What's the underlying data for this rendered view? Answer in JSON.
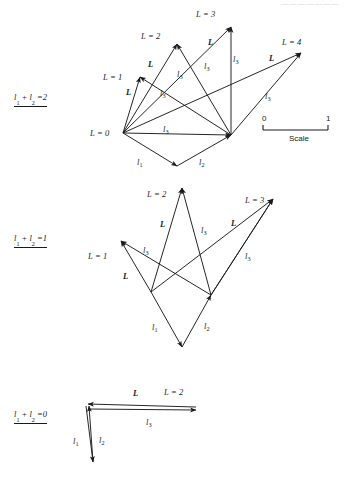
{
  "figure": {
    "header_ghost": "———————",
    "stroke_color": "#1a1a1a",
    "background_color": "#ffffff"
  },
  "panels": [
    {
      "id": "panel-top",
      "tag": "l₁ + l₂ = 2",
      "tag_parts": {
        "l1": "l",
        "sub1": "1",
        "plus": "+",
        "l2": "l",
        "sub2": "2",
        "eq": "=2"
      },
      "tag_pos": {
        "x": 14,
        "y": 92
      },
      "vertices": {
        "origin": {
          "label": "L = 0",
          "x": 123,
          "y": 133
        },
        "L1": {
          "label": "L = 1",
          "x": 140,
          "y": 77
        },
        "L2": {
          "label": "L = 2",
          "x": 177,
          "y": 44
        },
        "L3": {
          "label": "L = 3",
          "x": 231,
          "y": 27
        },
        "L4": {
          "label": "L = 4",
          "x": 301,
          "y": 53
        },
        "right": {
          "label": "",
          "x": 231,
          "y": 135
        },
        "bottom": {
          "label": "",
          "x": 177,
          "y": 166
        }
      },
      "arrows": [
        {
          "name": "L-to-L1",
          "x1": 123,
          "y1": 133,
          "x2": 140,
          "y2": 77,
          "label": "L"
        },
        {
          "name": "L-to-L2",
          "x1": 123,
          "y1": 133,
          "x2": 177,
          "y2": 44,
          "label": "L"
        },
        {
          "name": "L-to-L3",
          "x1": 123,
          "y1": 133,
          "x2": 231,
          "y2": 27,
          "label": "L"
        },
        {
          "name": "L-to-L4",
          "x1": 123,
          "y1": 133,
          "x2": 301,
          "y2": 53,
          "label": "L"
        },
        {
          "name": "l3-to-L1",
          "x1": 231,
          "y1": 135,
          "x2": 140,
          "y2": 77,
          "label": "l3"
        },
        {
          "name": "l3-to-L2",
          "x1": 231,
          "y1": 135,
          "x2": 177,
          "y2": 44,
          "label": "l3"
        },
        {
          "name": "l3-to-L3",
          "x1": 231,
          "y1": 135,
          "x2": 231,
          "y2": 27,
          "label": "l3"
        },
        {
          "name": "l3-to-L4",
          "x1": 231,
          "y1": 135,
          "x2": 301,
          "y2": 53,
          "label": "l3"
        },
        {
          "name": "l3-horizontal",
          "x1": 123,
          "y1": 133,
          "x2": 231,
          "y2": 135,
          "label": "l3"
        },
        {
          "name": "l1-arrow",
          "x1": 123,
          "y1": 133,
          "x2": 177,
          "y2": 166,
          "label": "l1"
        },
        {
          "name": "l2-arrow",
          "x1": 177,
          "y1": 166,
          "x2": 231,
          "y2": 135,
          "label": "l2"
        }
      ],
      "vertex_labels": [
        {
          "name": "vertex-label-L0",
          "text": "L = 0",
          "x": 90,
          "y": 129
        },
        {
          "name": "vertex-label-L1",
          "text": "L = 1",
          "x": 103,
          "y": 73
        },
        {
          "name": "vertex-label-L2",
          "text": "L = 2",
          "x": 141,
          "y": 32
        },
        {
          "name": "vertex-label-L3",
          "text": "L = 3",
          "x": 196,
          "y": 10
        },
        {
          "name": "vertex-label-L4",
          "text": "L = 4",
          "x": 282,
          "y": 38
        }
      ],
      "edge_labels": [
        {
          "name": "edge-label-L-a",
          "text": "L",
          "bold": true,
          "x": 126,
          "y": 88
        },
        {
          "name": "edge-label-L-b",
          "text": "L",
          "bold": true,
          "x": 148,
          "y": 60
        },
        {
          "name": "edge-label-L-c",
          "text": "L",
          "bold": true,
          "x": 208,
          "y": 38
        },
        {
          "name": "edge-label-L-d",
          "text": "L",
          "bold": true,
          "x": 269,
          "y": 54
        },
        {
          "name": "edge-label-l3-a",
          "text": "l3",
          "x": 160,
          "y": 89
        },
        {
          "name": "edge-label-l3-b",
          "text": "l3",
          "x": 177,
          "y": 70
        },
        {
          "name": "edge-label-l3-c",
          "text": "l3",
          "x": 204,
          "y": 62
        },
        {
          "name": "edge-label-l3-d",
          "text": "l3",
          "x": 233,
          "y": 55
        },
        {
          "name": "edge-label-l3-e",
          "text": "l3",
          "x": 265,
          "y": 92
        },
        {
          "name": "edge-label-l3-f",
          "text": "l3",
          "x": 163,
          "y": 125
        },
        {
          "name": "edge-label-l1",
          "text": "l1",
          "x": 137,
          "y": 158
        },
        {
          "name": "edge-label-l2",
          "text": "l2",
          "x": 199,
          "y": 158
        }
      ]
    },
    {
      "id": "panel-middle",
      "tag": "l₁ + l₂ = 1",
      "tag_pos": {
        "x": 14,
        "y": 233
      },
      "vertices": {
        "L1": {
          "label": "L = 1",
          "x": 121,
          "y": 241
        },
        "L2": {
          "label": "L = 2",
          "x": 182,
          "y": 188
        },
        "L3": {
          "label": "L = 3",
          "x": 273,
          "y": 199
        },
        "leftLow": {
          "label": "",
          "x": 151,
          "y": 292
        },
        "rightLow": {
          "label": "",
          "x": 211,
          "y": 295
        },
        "bottom": {
          "label": "",
          "x": 182,
          "y": 347
        }
      },
      "arrows": [
        {
          "name": "mid-L-to-L1",
          "x1": 151,
          "y1": 292,
          "x2": 121,
          "y2": 241,
          "label": "L"
        },
        {
          "name": "mid-L-to-L2",
          "x1": 151,
          "y1": 292,
          "x2": 182,
          "y2": 188,
          "label": "L"
        },
        {
          "name": "mid-L-to-L3",
          "x1": 211,
          "y1": 295,
          "x2": 273,
          "y2": 199,
          "label": "L"
        },
        {
          "name": "mid-l3-to-L1",
          "x1": 211,
          "y1": 295,
          "x2": 121,
          "y2": 241,
          "label": "l3"
        },
        {
          "name": "mid-l3-to-L2",
          "x1": 211,
          "y1": 295,
          "x2": 182,
          "y2": 188,
          "label": "l3"
        },
        {
          "name": "mid-l3-to-L3",
          "x1": 151,
          "y1": 292,
          "x2": 273,
          "y2": 199,
          "label": "l3"
        },
        {
          "name": "mid-l3-right",
          "x1": 211,
          "y1": 295,
          "x2": 273,
          "y2": 199,
          "label": "l3"
        },
        {
          "name": "mid-l1",
          "x1": 151,
          "y1": 292,
          "x2": 182,
          "y2": 347,
          "label": "l1"
        },
        {
          "name": "mid-l2",
          "x1": 182,
          "y1": 347,
          "x2": 211,
          "y2": 295,
          "label": "l2"
        }
      ],
      "vertex_labels": [
        {
          "name": "mid-vertex-label-L1",
          "text": "L = 1",
          "x": 88,
          "y": 252
        },
        {
          "name": "mid-vertex-label-L2",
          "text": "L = 2",
          "x": 147,
          "y": 190
        },
        {
          "name": "mid-vertex-label-L3",
          "text": "L = 3",
          "x": 245,
          "y": 196
        }
      ],
      "edge_labels": [
        {
          "name": "mid-edge-L-a",
          "text": "L",
          "bold": true,
          "x": 123,
          "y": 272
        },
        {
          "name": "mid-edge-L-b",
          "text": "L",
          "bold": true,
          "x": 160,
          "y": 220
        },
        {
          "name": "mid-edge-L-c",
          "text": "L",
          "bold": true,
          "x": 231,
          "y": 219
        },
        {
          "name": "mid-edge-l3-a",
          "text": "l3",
          "x": 143,
          "y": 246
        },
        {
          "name": "mid-edge-l3-b",
          "text": "l3",
          "x": 201,
          "y": 226
        },
        {
          "name": "mid-edge-l3-c",
          "text": "l3",
          "x": 245,
          "y": 252
        },
        {
          "name": "mid-edge-l1",
          "text": "l1",
          "x": 152,
          "y": 323
        },
        {
          "name": "mid-edge-l2",
          "text": "l2",
          "x": 204,
          "y": 322
        }
      ]
    },
    {
      "id": "panel-bottom",
      "tag": "l₁ + l₂ = 0",
      "tag_pos": {
        "x": 14,
        "y": 409
      },
      "vertices": {
        "left": {
          "label": "",
          "x": 88,
          "y": 406
        },
        "right": {
          "label": "L = 2",
          "x": 196,
          "y": 407
        },
        "bottom": {
          "label": "",
          "x": 95,
          "y": 462
        }
      },
      "arrows": [
        {
          "name": "bot-L-arrow",
          "x1": 196,
          "y1": 407,
          "x2": 88,
          "y2": 404,
          "label": "L"
        },
        {
          "name": "bot-l3-arrow",
          "x1": 88,
          "y1": 409,
          "x2": 196,
          "y2": 410,
          "label": "l3"
        },
        {
          "name": "bot-l1-arrow",
          "x1": 86,
          "y1": 406,
          "x2": 93,
          "y2": 462,
          "label": "l1"
        },
        {
          "name": "bot-l2-arrow",
          "x1": 93,
          "y1": 462,
          "x2": 89,
          "y2": 406,
          "label": "l2"
        }
      ],
      "vertex_labels": [
        {
          "name": "bot-vertex-label-L2",
          "text": "L = 2",
          "x": 164,
          "y": 388
        }
      ],
      "edge_labels": [
        {
          "name": "bot-edge-L",
          "text": "L",
          "bold": true,
          "x": 133,
          "y": 389
        },
        {
          "name": "bot-edge-l3",
          "text": "l3",
          "x": 146,
          "y": 418
        },
        {
          "name": "bot-edge-l1",
          "text": "l1",
          "x": 73,
          "y": 437
        },
        {
          "name": "bot-edge-l2",
          "text": "l2",
          "x": 99,
          "y": 436
        }
      ]
    }
  ],
  "scale_bar": {
    "label": "Scale",
    "tick_min": "0",
    "tick_max": "1",
    "x_left": 263,
    "x_right": 328,
    "y_line": 130,
    "num_y": 114,
    "word_y": 134
  }
}
